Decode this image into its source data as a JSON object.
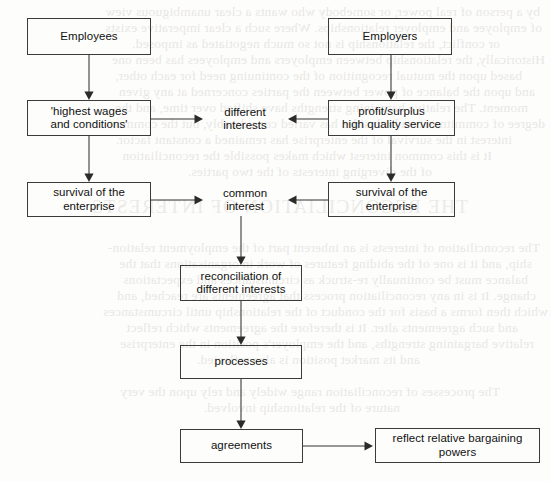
{
  "document": {
    "type": "flowchart",
    "title": "Employment relations: different interests and common interest flowchart",
    "page_background": "#fdfdfc",
    "ink_color": "#111111",
    "line_color": "#333333"
  },
  "nodes": [
    {
      "id": "employees",
      "label": "Employees",
      "boxed": true,
      "x": 27,
      "y": 18,
      "w": 124,
      "h": 37
    },
    {
      "id": "employers",
      "label": "Employers",
      "boxed": true,
      "x": 328,
      "y": 18,
      "w": 124,
      "h": 37
    },
    {
      "id": "highest_wages",
      "label": "'highest wages\nand conditions'",
      "boxed": true,
      "x": 27,
      "y": 100,
      "w": 124,
      "h": 36
    },
    {
      "id": "profit_surplus",
      "label": "profit/surplus\nhigh quality service",
      "boxed": true,
      "x": 328,
      "y": 100,
      "w": 127,
      "h": 36
    },
    {
      "id": "different_int",
      "label": "different\ninterests",
      "boxed": false,
      "x": 206,
      "y": 104,
      "w": 78,
      "h": 30
    },
    {
      "id": "survival_left",
      "label": "survival of the\nenterprise",
      "boxed": true,
      "x": 27,
      "y": 182,
      "w": 124,
      "h": 35
    },
    {
      "id": "survival_right",
      "label": "survival of the\nenterprise",
      "boxed": true,
      "x": 328,
      "y": 182,
      "w": 127,
      "h": 35
    },
    {
      "id": "common_int",
      "label": "common\ninterest",
      "boxed": false,
      "x": 206,
      "y": 185,
      "w": 78,
      "h": 30
    },
    {
      "id": "reconciliation",
      "label": "reconciliation of\ndifferent interests",
      "boxed": true,
      "x": 180,
      "y": 265,
      "w": 122,
      "h": 36
    },
    {
      "id": "processes",
      "label": "processes",
      "boxed": true,
      "x": 180,
      "y": 345,
      "w": 122,
      "h": 34
    },
    {
      "id": "agreements",
      "label": "agreements",
      "boxed": true,
      "x": 180,
      "y": 429,
      "w": 123,
      "h": 34
    },
    {
      "id": "bargaining",
      "label": "reflect relative bargaining powers",
      "boxed": true,
      "x": 375,
      "y": 428,
      "w": 165,
      "h": 35
    }
  ],
  "edges": [
    {
      "id": "e-employees-wages",
      "from": "employees",
      "to": "highest_wages",
      "direction": "down",
      "x1": 89,
      "y1": 55,
      "x2": 89,
      "y2": 100
    },
    {
      "id": "e-employers-profit",
      "from": "employers",
      "to": "profit_surplus",
      "direction": "down",
      "x1": 391,
      "y1": 55,
      "x2": 391,
      "y2": 100
    },
    {
      "id": "e-wages-different",
      "from": "highest_wages",
      "to": "different_int",
      "direction": "right",
      "x1": 151,
      "y1": 119,
      "x2": 203,
      "y2": 119
    },
    {
      "id": "e-profit-different",
      "from": "profit_surplus",
      "to": "different_int",
      "direction": "left",
      "x1": 328,
      "y1": 119,
      "x2": 288,
      "y2": 119
    },
    {
      "id": "e-wages-survivalleft",
      "from": "highest_wages",
      "to": "survival_left",
      "direction": "down",
      "x1": 89,
      "y1": 136,
      "x2": 89,
      "y2": 182
    },
    {
      "id": "e-profit-survivalright",
      "from": "profit_surplus",
      "to": "survival_right",
      "direction": "down",
      "x1": 391,
      "y1": 136,
      "x2": 391,
      "y2": 182
    },
    {
      "id": "e-survivalleft-common",
      "from": "survival_left",
      "to": "common_int",
      "direction": "right",
      "x1": 151,
      "y1": 200,
      "x2": 203,
      "y2": 200
    },
    {
      "id": "e-survivalright-common",
      "from": "survival_right",
      "to": "common_int",
      "direction": "left",
      "x1": 328,
      "y1": 200,
      "x2": 288,
      "y2": 200
    },
    {
      "id": "e-common-reconciliation",
      "from": "common_int",
      "to": "reconciliation",
      "direction": "down",
      "x1": 241,
      "y1": 216,
      "x2": 241,
      "y2": 265
    },
    {
      "id": "e-reconciliation-process",
      "from": "reconciliation",
      "to": "processes",
      "direction": "down",
      "x1": 241,
      "y1": 301,
      "x2": 241,
      "y2": 345
    },
    {
      "id": "e-process-agreements",
      "from": "processes",
      "to": "agreements",
      "direction": "down",
      "x1": 241,
      "y1": 379,
      "x2": 241,
      "y2": 429
    },
    {
      "id": "e-agreements-bargaining",
      "from": "agreements",
      "to": "bargaining",
      "direction": "right",
      "x1": 303,
      "y1": 446,
      "x2": 373,
      "y2": 446
    }
  ],
  "background_bleed": {
    "note": "faint mirrored show-through text from the reverse side of the scanned page",
    "lines": [
      {
        "text": "by a person of real power, or somebody who wants a clear unambiguous view",
        "x": 540,
        "y": 4,
        "size": 13.5,
        "style": "normal"
      },
      {
        "text": "of employee and employer relationships. Where such a clear imperative exists",
        "x": 542,
        "y": 20,
        "size": 13.5,
        "style": "normal"
      },
      {
        "text": "or conflict, the relationship is not so much negotiated as imposed.",
        "x": 500,
        "y": 36,
        "size": 13.5,
        "style": "normal"
      },
      {
        "text": "Historically, the relationship between employers and employees has been one",
        "x": 545,
        "y": 52,
        "size": 13.5,
        "style": "normal"
      },
      {
        "text": "based upon the mutual recognition of the continuing need for each other,",
        "x": 522,
        "y": 68,
        "size": 13.5,
        "style": "normal"
      },
      {
        "text": "and upon the balance of power between the parties concerned at any given",
        "x": 535,
        "y": 84,
        "size": 13.5,
        "style": "normal"
      },
      {
        "text": "moment. The relative bargaining strengths have shifted over time, and the",
        "x": 528,
        "y": 100,
        "size": 13.5,
        "style": "normal"
      },
      {
        "text": "degree of commitment on both sides has varied considerably, but the common",
        "x": 545,
        "y": 116,
        "size": 13.5,
        "style": "normal"
      },
      {
        "text": "interest in the survival of the enterprise has remained a constant factor.",
        "x": 512,
        "y": 132,
        "size": 13.5,
        "style": "normal"
      },
      {
        "text": "It is this common interest which makes possible the reconciliation",
        "x": 492,
        "y": 148,
        "size": 13.5,
        "style": "normal"
      },
      {
        "text": "of the diverging interests of the two parties.",
        "x": 432,
        "y": 164,
        "size": 13.5,
        "style": "normal"
      },
      {
        "text": "THE RECONCILIATION OF INTERESTS",
        "x": 468,
        "y": 196,
        "size": 19,
        "style": "head"
      },
      {
        "text": "The reconciliation of interests is an inherent part of the employment relation-",
        "x": 540,
        "y": 240,
        "size": 13.5,
        "style": "normal"
      },
      {
        "text": "ship, and it is one of the abiding features of work in organisations that the",
        "x": 532,
        "y": 256,
        "size": 13.5,
        "style": "normal"
      },
      {
        "text": "balance must be continually re-struck as circumstances and expectations",
        "x": 528,
        "y": 272,
        "size": 13.5,
        "style": "normal"
      },
      {
        "text": "change. It is in any reconciliation process that agreements are reached, and",
        "x": 536,
        "y": 288,
        "size": 13.5,
        "style": "normal"
      },
      {
        "text": "which then forms a basis for the conduct of the relationship until circumstances",
        "x": 548,
        "y": 304,
        "size": 13.5,
        "style": "normal"
      },
      {
        "text": "and such agreements alter. It is therefore the agreements which reflect",
        "x": 518,
        "y": 320,
        "size": 13.5,
        "style": "normal"
      },
      {
        "text": "relative bargaining strengths, and the employer's position in the enterprise",
        "x": 534,
        "y": 336,
        "size": 13.5,
        "style": "normal"
      },
      {
        "text": "and its market position is also reflected.",
        "x": 420,
        "y": 352,
        "size": 13.5,
        "style": "normal"
      },
      {
        "text": "The processes of reconciliation range widely and rely upon the very",
        "x": 500,
        "y": 384,
        "size": 13.5,
        "style": "normal"
      },
      {
        "text": "nature of the relationship involved.",
        "x": 400,
        "y": 400,
        "size": 13.5,
        "style": "normal"
      }
    ]
  }
}
